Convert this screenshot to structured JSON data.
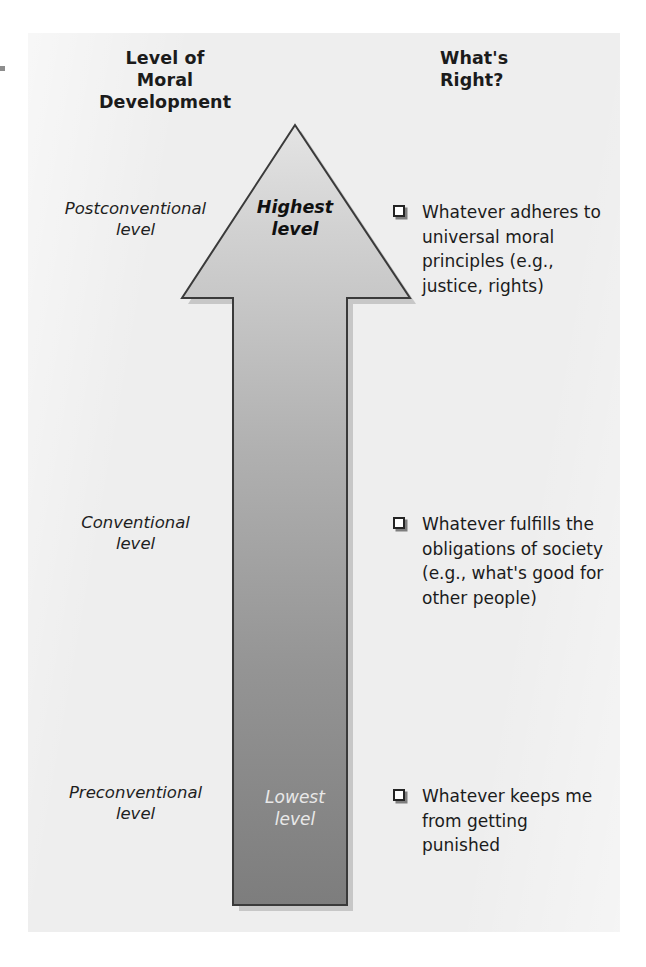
{
  "figure": {
    "headers": {
      "left": "Level of\nMoral\nDevelopment",
      "right": "What's\nRight?"
    },
    "arrow": {
      "top_label": "Highest\nlevel",
      "bottom_label": "Lowest\nlevel",
      "direction": "up",
      "gradient_top_color": "#d2d2d2",
      "gradient_bottom_color": "#7f7f7f",
      "outline_color": "#3a3a3a"
    },
    "levels": [
      {
        "label": "Postconventional\nlevel",
        "whats_right": "Whatever adheres to\nuniversal moral\nprinciples (e.g.,\njustice, rights)",
        "bullet_icon": "checkbox-icon"
      },
      {
        "label": "Conventional\nlevel",
        "whats_right": "Whatever fulfills the\nobligations of society\n(e.g., what's good for\nother people)",
        "bullet_icon": "checkbox-icon"
      },
      {
        "label": "Preconventional\nlevel",
        "whats_right": "Whatever keeps me\nfrom getting\npunished",
        "bullet_icon": "checkbox-icon"
      }
    ],
    "panel_color": "#eeeeee",
    "page_color": "#ffffff"
  }
}
